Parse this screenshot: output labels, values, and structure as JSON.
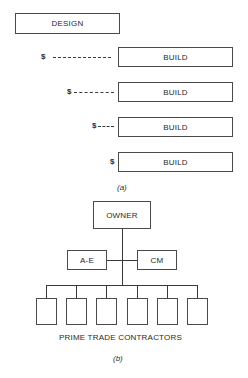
{
  "part_a": {
    "design_label": "DESIGN",
    "build_rows": [
      {
        "label": "BUILD",
        "currency": "$"
      },
      {
        "label": "BUILD",
        "currency": "$"
      },
      {
        "label": "BUILD",
        "currency": "$"
      },
      {
        "label": "BUILD",
        "currency": "$"
      }
    ],
    "caption": "(a)"
  },
  "part_b": {
    "owner_label": "OWNER",
    "ae_label": "A-E",
    "cm_label": "CM",
    "contractor_count": 6,
    "contractors_label": "PRIME TRADE CONTRACTORS",
    "caption": "(b)"
  }
}
